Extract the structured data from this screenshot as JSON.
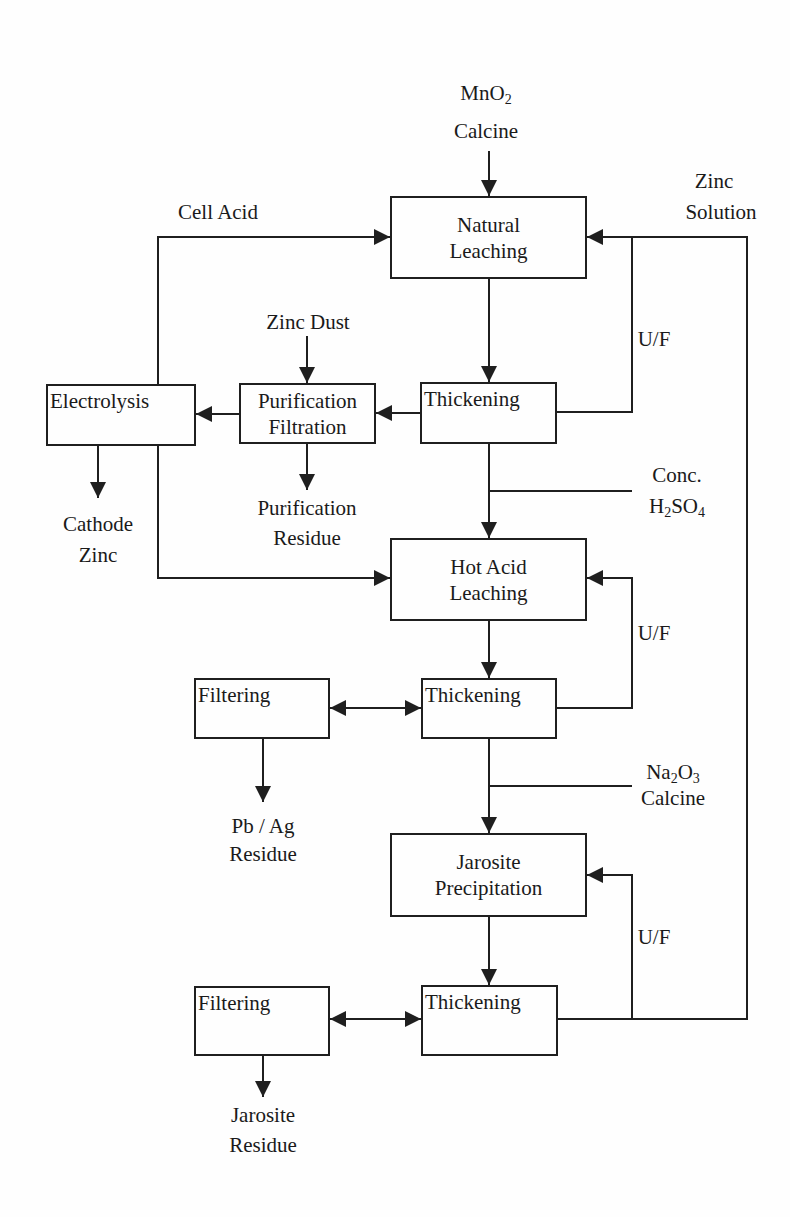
{
  "diagram": {
    "type": "process-flow",
    "colors": {
      "line": "#1f1f1f",
      "text": "#1a1a1a",
      "background": "#fefefe"
    }
  },
  "inputs": {
    "mno2_calcine": {
      "line1_main": "MnO",
      "line1_sub": "2",
      "line2": "Calcine"
    },
    "cell_acid": {
      "text": "Cell Acid"
    },
    "zinc_solution": {
      "line1": "Zinc",
      "line2": "Solution"
    },
    "zinc_dust": {
      "text": "Zinc Dust"
    },
    "conc_h2so4": {
      "line1": "Conc.",
      "line2_a": "H",
      "line2_sub1": "2",
      "line2_b": "SO",
      "line2_sub2": "4"
    },
    "na2o3_calcine": {
      "line1_a": "Na",
      "line1_sub1": "2",
      "line1_b": "O",
      "line1_sub2": "3",
      "line2": "Calcine"
    }
  },
  "boxes": {
    "natural_leaching": {
      "line1": "Natural",
      "line2": "Leaching"
    },
    "thickening_1": {
      "text": "Thickening"
    },
    "purification_filtration": {
      "line1": "Purification",
      "line2": "Filtration"
    },
    "electrolysis": {
      "text": "Electrolysis"
    },
    "hot_acid_leaching": {
      "line1": "Hot Acid",
      "line2": "Leaching"
    },
    "thickening_2": {
      "text": "Thickening"
    },
    "filtering_1": {
      "text": "Filtering"
    },
    "jarosite_precipitation": {
      "line1": "Jarosite",
      "line2": "Precipitation"
    },
    "thickening_3": {
      "text": "Thickening"
    },
    "filtering_2": {
      "text": "Filtering"
    }
  },
  "outputs": {
    "cathode_zinc": {
      "line1": "Cathode",
      "line2": "Zinc"
    },
    "purification_residue": {
      "line1": "Purification",
      "line2": "Residue"
    },
    "pb_ag_residue": {
      "line1": "Pb / Ag",
      "line2": "Residue"
    },
    "jarosite_residue": {
      "line1": "Jarosite",
      "line2": "Residue"
    }
  },
  "underflow_labels": {
    "uf_1": "U/F",
    "uf_2": "U/F",
    "uf_3": "U/F"
  }
}
